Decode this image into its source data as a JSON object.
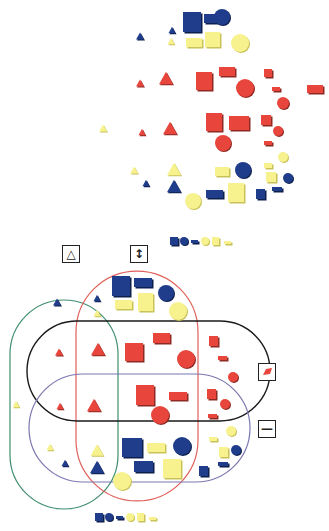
{
  "figure": {
    "colors": {
      "blue": "#1f3d8a",
      "red": "#e8453c",
      "yellow": "#f7f28e",
      "loop_triangle": "#3f8f6e",
      "loop_large": "#e0605a",
      "loop_red": "#1a1a1a",
      "loop_thin": "#7b78b0"
    }
  },
  "loop_labels": [
    {
      "id": "triangle",
      "symbol": "△",
      "x": 62,
      "y": 245
    },
    {
      "id": "large",
      "symbol": "↕",
      "x": 130,
      "y": 245
    },
    {
      "id": "red",
      "symbol": "red-shape",
      "x": 258,
      "y": 363
    },
    {
      "id": "thin",
      "symbol": "—",
      "x": 258,
      "y": 420
    }
  ],
  "legends": [
    {
      "id": "top-legend",
      "x": 170,
      "y": 237
    },
    {
      "id": "bottom-legend",
      "x": 95,
      "y": 513
    }
  ],
  "unsorted_blocks": [
    {
      "shape": "triangle",
      "color": "blue",
      "x": 140,
      "y": 36,
      "s": 8
    },
    {
      "shape": "triangle",
      "color": "blue",
      "x": 172,
      "y": 30,
      "s": 7
    },
    {
      "shape": "square",
      "color": "blue",
      "x": 183,
      "y": 12,
      "w": 18,
      "h": 20
    },
    {
      "shape": "rect",
      "color": "blue",
      "x": 204,
      "y": 14,
      "w": 17,
      "h": 9
    },
    {
      "shape": "circle",
      "color": "blue",
      "x": 222,
      "y": 17,
      "r": 8
    },
    {
      "shape": "triangle",
      "color": "yellow",
      "x": 171,
      "y": 41,
      "s": 7
    },
    {
      "shape": "rect",
      "color": "yellow",
      "x": 186,
      "y": 38,
      "w": 16,
      "h": 9
    },
    {
      "shape": "square",
      "color": "yellow",
      "x": 205,
      "y": 32,
      "w": 15,
      "h": 15
    },
    {
      "shape": "circle",
      "color": "yellow",
      "x": 240,
      "y": 43,
      "r": 9
    },
    {
      "shape": "triangle",
      "color": "red",
      "x": 140,
      "y": 83,
      "s": 8
    },
    {
      "shape": "triangle",
      "color": "red",
      "x": 166,
      "y": 78,
      "s": 14
    },
    {
      "shape": "square",
      "color": "red",
      "x": 196,
      "y": 72,
      "w": 16,
      "h": 18
    },
    {
      "shape": "rect",
      "color": "red",
      "x": 219,
      "y": 67,
      "w": 16,
      "h": 9
    },
    {
      "shape": "circle",
      "color": "red",
      "x": 245,
      "y": 88,
      "r": 9
    },
    {
      "shape": "square",
      "color": "red",
      "x": 264,
      "y": 69,
      "w": 8,
      "h": 8
    },
    {
      "shape": "rect",
      "color": "red",
      "x": 272,
      "y": 87,
      "w": 8,
      "h": 4
    },
    {
      "shape": "rect",
      "color": "red",
      "x": 307,
      "y": 85,
      "w": 16,
      "h": 8
    },
    {
      "shape": "circle",
      "color": "red",
      "x": 283,
      "y": 103,
      "r": 6
    },
    {
      "shape": "triangle",
      "color": "yellow",
      "x": 103,
      "y": 128,
      "s": 8
    },
    {
      "shape": "triangle",
      "color": "red",
      "x": 142,
      "y": 132,
      "s": 7
    },
    {
      "shape": "triangle",
      "color": "red",
      "x": 170,
      "y": 128,
      "s": 14
    },
    {
      "shape": "square",
      "color": "red",
      "x": 206,
      "y": 113,
      "w": 16,
      "h": 18
    },
    {
      "shape": "rect",
      "color": "red",
      "x": 229,
      "y": 116,
      "w": 20,
      "h": 14
    },
    {
      "shape": "circle",
      "color": "red",
      "x": 223,
      "y": 143,
      "r": 8
    },
    {
      "shape": "square",
      "color": "red",
      "x": 261,
      "y": 115,
      "w": 10,
      "h": 10
    },
    {
      "shape": "circle",
      "color": "red",
      "x": 278,
      "y": 131,
      "r": 5
    },
    {
      "shape": "rect",
      "color": "red",
      "x": 264,
      "y": 141,
      "w": 8,
      "h": 4
    },
    {
      "shape": "triangle",
      "color": "yellow",
      "x": 134,
      "y": 170,
      "s": 8
    },
    {
      "shape": "triangle",
      "color": "yellow",
      "x": 174,
      "y": 169,
      "s": 14
    },
    {
      "shape": "rect",
      "color": "yellow",
      "x": 215,
      "y": 167,
      "w": 14,
      "h": 9
    },
    {
      "shape": "circle",
      "color": "blue",
      "x": 243,
      "y": 170,
      "r": 8
    },
    {
      "shape": "rect",
      "color": "yellow",
      "x": 264,
      "y": 163,
      "w": 8,
      "h": 5
    },
    {
      "shape": "circle",
      "color": "yellow",
      "x": 283,
      "y": 157,
      "r": 5
    },
    {
      "shape": "square",
      "color": "yellow",
      "x": 266,
      "y": 172,
      "w": 10,
      "h": 10
    },
    {
      "shape": "circle",
      "color": "blue",
      "x": 288,
      "y": 178,
      "r": 5
    },
    {
      "shape": "triangle",
      "color": "blue",
      "x": 146,
      "y": 183,
      "s": 7
    },
    {
      "shape": "triangle",
      "color": "blue",
      "x": 174,
      "y": 186,
      "s": 14
    },
    {
      "shape": "circle",
      "color": "yellow",
      "x": 193,
      "y": 201,
      "r": 8
    },
    {
      "shape": "rect",
      "color": "blue",
      "x": 206,
      "y": 190,
      "w": 17,
      "h": 8
    },
    {
      "shape": "square",
      "color": "yellow",
      "x": 228,
      "y": 183,
      "w": 16,
      "h": 19
    },
    {
      "shape": "square",
      "color": "blue",
      "x": 256,
      "y": 189,
      "w": 9,
      "h": 10
    },
    {
      "shape": "rect",
      "color": "blue",
      "x": 272,
      "y": 187,
      "w": 10,
      "h": 4
    }
  ],
  "sorted_blocks": [
    {
      "shape": "triangle",
      "color": "blue",
      "x": 57,
      "y": 302,
      "s": 8
    },
    {
      "shape": "triangle",
      "color": "blue",
      "x": 97,
      "y": 298,
      "s": 7
    },
    {
      "shape": "square",
      "color": "blue",
      "x": 112,
      "y": 276,
      "w": 18,
      "h": 20
    },
    {
      "shape": "rect",
      "color": "blue",
      "x": 134,
      "y": 278,
      "w": 18,
      "h": 9
    },
    {
      "shape": "circle",
      "color": "blue",
      "x": 166,
      "y": 293,
      "r": 8
    },
    {
      "shape": "triangle",
      "color": "yellow",
      "x": 97,
      "y": 313,
      "s": 7
    },
    {
      "shape": "rect",
      "color": "yellow",
      "x": 115,
      "y": 300,
      "w": 17,
      "h": 9
    },
    {
      "shape": "square",
      "color": "yellow",
      "x": 138,
      "y": 293,
      "w": 15,
      "h": 18
    },
    {
      "shape": "circle",
      "color": "yellow",
      "x": 178,
      "y": 311,
      "r": 9
    },
    {
      "shape": "triangle",
      "color": "red",
      "x": 59,
      "y": 352,
      "s": 8
    },
    {
      "shape": "triangle",
      "color": "red",
      "x": 98,
      "y": 349,
      "s": 14
    },
    {
      "shape": "square",
      "color": "red",
      "x": 125,
      "y": 343,
      "w": 18,
      "h": 18
    },
    {
      "shape": "rect",
      "color": "red",
      "x": 153,
      "y": 333,
      "w": 17,
      "h": 10
    },
    {
      "shape": "circle",
      "color": "red",
      "x": 186,
      "y": 359,
      "r": 9
    },
    {
      "shape": "square",
      "color": "red",
      "x": 209,
      "y": 336,
      "w": 9,
      "h": 10
    },
    {
      "shape": "rect",
      "color": "red",
      "x": 218,
      "y": 356,
      "w": 9,
      "h": 4
    },
    {
      "shape": "circle",
      "color": "red",
      "x": 233,
      "y": 377,
      "r": 5
    },
    {
      "shape": "triangle",
      "color": "red",
      "x": 60,
      "y": 406,
      "s": 7
    },
    {
      "shape": "triangle",
      "color": "red",
      "x": 94,
      "y": 405,
      "s": 14
    },
    {
      "shape": "square",
      "color": "red",
      "x": 136,
      "y": 385,
      "w": 18,
      "h": 20
    },
    {
      "shape": "rect",
      "color": "red",
      "x": 169,
      "y": 392,
      "w": 18,
      "h": 8
    },
    {
      "shape": "circle",
      "color": "red",
      "x": 160,
      "y": 415,
      "r": 9
    },
    {
      "shape": "square",
      "color": "red",
      "x": 207,
      "y": 389,
      "w": 9,
      "h": 10
    },
    {
      "shape": "circle",
      "color": "red",
      "x": 225,
      "y": 404,
      "r": 5
    },
    {
      "shape": "rect",
      "color": "red",
      "x": 208,
      "y": 414,
      "w": 9,
      "h": 4
    },
    {
      "shape": "triangle",
      "color": "yellow",
      "x": 16,
      "y": 404,
      "s": 7
    },
    {
      "shape": "triangle",
      "color": "yellow",
      "x": 50,
      "y": 447,
      "s": 7
    },
    {
      "shape": "triangle",
      "color": "yellow",
      "x": 97,
      "y": 450,
      "s": 13
    },
    {
      "shape": "triangle",
      "color": "blue",
      "x": 65,
      "y": 463,
      "s": 7
    },
    {
      "shape": "triangle",
      "color": "blue",
      "x": 97,
      "y": 467,
      "s": 14
    },
    {
      "shape": "square",
      "color": "blue",
      "x": 122,
      "y": 438,
      "w": 20,
      "h": 19
    },
    {
      "shape": "rect",
      "color": "yellow",
      "x": 147,
      "y": 443,
      "w": 18,
      "h": 9
    },
    {
      "shape": "circle",
      "color": "blue",
      "x": 182,
      "y": 446,
      "r": 9
    },
    {
      "shape": "rect",
      "color": "blue",
      "x": 134,
      "y": 461,
      "w": 19,
      "h": 11
    },
    {
      "shape": "square",
      "color": "yellow",
      "x": 163,
      "y": 459,
      "w": 18,
      "h": 19
    },
    {
      "shape": "circle",
      "color": "yellow",
      "x": 122,
      "y": 481,
      "r": 9
    },
    {
      "shape": "square",
      "color": "blue",
      "x": 199,
      "y": 466,
      "w": 9,
      "h": 10
    },
    {
      "shape": "circle",
      "color": "yellow",
      "x": 231,
      "y": 431,
      "r": 5
    },
    {
      "shape": "rect",
      "color": "yellow",
      "x": 209,
      "y": 437,
      "w": 8,
      "h": 4
    },
    {
      "shape": "square",
      "color": "yellow",
      "x": 219,
      "y": 447,
      "w": 9,
      "h": 10
    },
    {
      "shape": "circle",
      "color": "blue",
      "x": 236,
      "y": 450,
      "r": 5
    },
    {
      "shape": "rect",
      "color": "blue",
      "x": 218,
      "y": 462,
      "w": 10,
      "h": 4
    }
  ]
}
